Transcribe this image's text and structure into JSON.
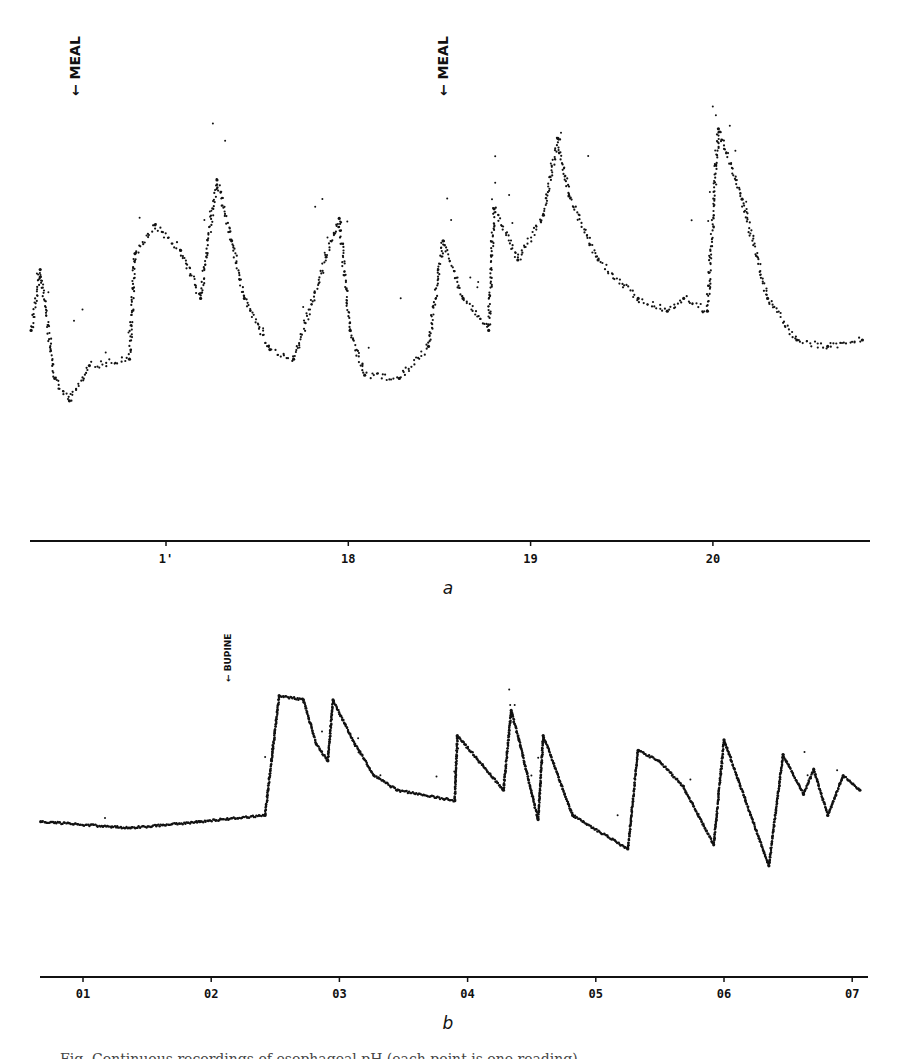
{
  "caption": "Fig. Continuous recordings of esophageal pH (each point is one reading)",
  "chart_data": [
    {
      "type": "scatter",
      "panel": "a",
      "title": "",
      "xlabel": "",
      "ylabel": "",
      "x_unit": "hour of day",
      "y_unit": "relative level (no y-axis printed; 0 = bottom of trace area, 1 = top)",
      "xlim": [
        16.25,
        20.85
      ],
      "ylim": [
        0,
        1
      ],
      "x_ticks": [
        17,
        18,
        19,
        20
      ],
      "x_tick_labels": [
        "1'",
        "18",
        "19",
        "20"
      ],
      "grid": false,
      "legend": "none",
      "annotations": [
        {
          "label": "MEAL",
          "x": 16.5,
          "arrow": "down"
        },
        {
          "label": "MEAL",
          "x": 18.52,
          "arrow": "down"
        }
      ],
      "points": [
        [
          16.26,
          0.28
        ],
        [
          16.31,
          0.47
        ],
        [
          16.39,
          0.13
        ],
        [
          16.47,
          0.06
        ],
        [
          16.58,
          0.17
        ],
        [
          16.8,
          0.19
        ],
        [
          16.83,
          0.52
        ],
        [
          16.94,
          0.61
        ],
        [
          17.08,
          0.53
        ],
        [
          17.19,
          0.38
        ],
        [
          17.28,
          0.75
        ],
        [
          17.36,
          0.56
        ],
        [
          17.43,
          0.38
        ],
        [
          17.57,
          0.22
        ],
        [
          17.7,
          0.19
        ],
        [
          17.95,
          0.63
        ],
        [
          18.01,
          0.28
        ],
        [
          18.09,
          0.14
        ],
        [
          18.28,
          0.13
        ],
        [
          18.44,
          0.23
        ],
        [
          18.52,
          0.56
        ],
        [
          18.63,
          0.38
        ],
        [
          18.77,
          0.28
        ],
        [
          18.8,
          0.66
        ],
        [
          18.93,
          0.5
        ],
        [
          19.07,
          0.64
        ],
        [
          19.15,
          0.88
        ],
        [
          19.21,
          0.7
        ],
        [
          19.37,
          0.5
        ],
        [
          19.59,
          0.38
        ],
        [
          19.75,
          0.34
        ],
        [
          19.84,
          0.38
        ],
        [
          19.97,
          0.34
        ],
        [
          20.03,
          0.91
        ],
        [
          20.16,
          0.69
        ],
        [
          20.3,
          0.38
        ],
        [
          20.46,
          0.25
        ],
        [
          20.63,
          0.23
        ],
        [
          20.82,
          0.25
        ]
      ]
    },
    {
      "type": "scatter",
      "panel": "b",
      "title": "",
      "xlabel": "",
      "ylabel": "",
      "x_unit": "hour of day",
      "y_unit": "relative level (no y-axis printed; 0 = bottom of trace area, 1 = top)",
      "xlim": [
        0.67,
        7.1
      ],
      "ylim": [
        0,
        1
      ],
      "x_ticks": [
        1,
        2,
        3,
        4,
        5,
        6,
        7
      ],
      "x_tick_labels": [
        "01",
        "02",
        "03",
        "04",
        "05",
        "06",
        "07"
      ],
      "grid": false,
      "legend": "none",
      "annotations": [
        {
          "label": "BUPINE",
          "x": 2.13,
          "arrow": "down"
        }
      ],
      "points": [
        [
          0.67,
          0.23
        ],
        [
          1.37,
          0.2
        ],
        [
          1.91,
          0.23
        ],
        [
          2.42,
          0.26
        ],
        [
          2.47,
          0.52
        ],
        [
          2.53,
          0.83
        ],
        [
          2.72,
          0.81
        ],
        [
          2.82,
          0.6
        ],
        [
          2.91,
          0.52
        ],
        [
          2.95,
          0.81
        ],
        [
          3.12,
          0.6
        ],
        [
          3.27,
          0.45
        ],
        [
          3.45,
          0.38
        ],
        [
          3.9,
          0.33
        ],
        [
          3.92,
          0.64
        ],
        [
          4.28,
          0.38
        ],
        [
          4.34,
          0.76
        ],
        [
          4.4,
          0.62
        ],
        [
          4.55,
          0.24
        ],
        [
          4.59,
          0.64
        ],
        [
          4.82,
          0.26
        ],
        [
          5.25,
          0.1
        ],
        [
          5.33,
          0.57
        ],
        [
          5.49,
          0.52
        ],
        [
          5.68,
          0.4
        ],
        [
          5.92,
          0.12
        ],
        [
          6.0,
          0.62
        ],
        [
          6.35,
          0.02
        ],
        [
          6.46,
          0.55
        ],
        [
          6.62,
          0.36
        ],
        [
          6.7,
          0.48
        ],
        [
          6.81,
          0.26
        ],
        [
          6.93,
          0.45
        ],
        [
          7.06,
          0.38
        ]
      ]
    }
  ],
  "panels": {
    "a": {
      "label": "a"
    },
    "b": {
      "label": "b"
    }
  }
}
